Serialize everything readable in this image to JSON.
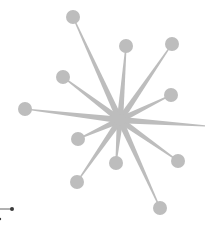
{
  "diagram": {
    "type": "star-network",
    "colors": {
      "node": "#bdbdbd",
      "edge": "#bdbdbd",
      "fragment": "#3a3a3a",
      "background": "#ffffff"
    },
    "hub": {
      "x": 120,
      "y": 120,
      "r": 6
    },
    "node_radius": 7,
    "nodes": [
      {
        "id": "n1",
        "x": 73,
        "y": 17
      },
      {
        "id": "n2",
        "x": 126,
        "y": 46
      },
      {
        "id": "n3",
        "x": 172,
        "y": 44
      },
      {
        "id": "n4",
        "x": 63,
        "y": 77
      },
      {
        "id": "n5",
        "x": 171,
        "y": 95
      },
      {
        "id": "n6",
        "x": 25,
        "y": 109
      },
      {
        "id": "n7",
        "x": 78,
        "y": 139
      },
      {
        "id": "n8",
        "x": 116,
        "y": 163
      },
      {
        "id": "n9",
        "x": 178,
        "y": 161
      },
      {
        "id": "n10",
        "x": 77,
        "y": 182
      },
      {
        "id": "n11",
        "x": 160,
        "y": 208
      }
    ],
    "offscreen_edges": [
      {
        "id": "e-right",
        "x": 206,
        "y": 126
      }
    ],
    "fragment": {
      "line": {
        "x1": 0,
        "y1": 209,
        "x2": 12,
        "y2": 209
      },
      "dots": [
        {
          "x": 12,
          "y": 209,
          "r": 2
        },
        {
          "x": 0,
          "y": 219,
          "r": 1.2
        }
      ]
    }
  }
}
